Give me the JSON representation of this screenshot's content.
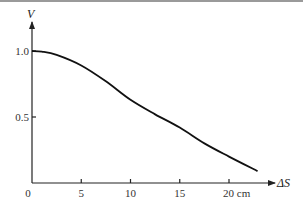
{
  "chart_data": {
    "type": "line",
    "title": "",
    "xlabel": "ΔS",
    "ylabel": "V",
    "x_unit": "cm",
    "xlim": [
      0,
      25
    ],
    "ylim": [
      0,
      1.15
    ],
    "grid": false,
    "x_ticks": [
      {
        "value": 0,
        "label": "0"
      },
      {
        "value": 5,
        "label": "5"
      },
      {
        "value": 10,
        "label": "10"
      },
      {
        "value": 15,
        "label": "15"
      },
      {
        "value": 20,
        "label": "20 cm"
      }
    ],
    "y_ticks": [
      {
        "value": 0.5,
        "label": "0.5"
      },
      {
        "value": 1.0,
        "label": "1.0"
      }
    ],
    "series": [
      {
        "name": "V",
        "x": [
          0,
          1,
          2.5,
          5,
          7.5,
          10,
          12.5,
          15,
          17.5,
          20,
          22.9
        ],
        "y": [
          1.0,
          0.995,
          0.97,
          0.89,
          0.77,
          0.63,
          0.52,
          0.42,
          0.3,
          0.2,
          0.09
        ]
      }
    ]
  }
}
